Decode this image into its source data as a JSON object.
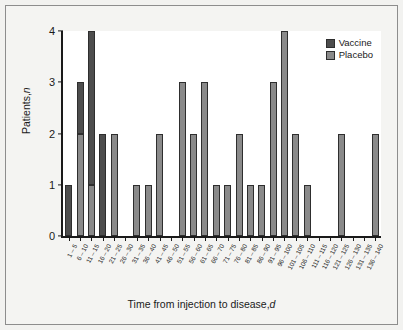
{
  "chart_data": {
    "type": "bar",
    "stacked": true,
    "title": "",
    "xlabel": "Time from injection to disease, d",
    "xlabel_plain": "Time from injection to disease,",
    "xlabel_italic": "d",
    "ylabel": "Patients, n",
    "ylabel_plain": "Patients,",
    "ylabel_italic": "n",
    "ylim": [
      0,
      4
    ],
    "yticks": [
      0,
      1,
      2,
      3,
      4
    ],
    "ytick_labels": [
      "0",
      "1",
      "2",
      "3",
      "4"
    ],
    "grid": false,
    "legend_position": "top-right",
    "categories": [
      "1 – 5",
      "6 – 10",
      "11 – 15",
      "16 – 20",
      "21 – 25",
      "26 – 30",
      "31 – 35",
      "36 – 40",
      "41 – 45",
      "46 – 50",
      "51 – 55",
      "56 – 60",
      "61 – 65",
      "66 – 70",
      "71 – 75",
      "76 – 80",
      "81 – 85",
      "86 – 90",
      "91 – 95",
      "96 – 100",
      "101 – 105",
      "106 – 110",
      "111 – 115",
      "116 – 120",
      "121 – 125",
      "126 – 130",
      "131 – 135",
      "136 – 140"
    ],
    "series": [
      {
        "name": "Vaccine",
        "color": "#4d4d4d",
        "values": [
          1,
          1,
          3,
          2,
          0,
          0,
          0,
          0,
          0,
          0,
          0,
          0,
          0,
          0,
          0,
          0,
          0,
          0,
          0,
          0,
          0,
          0,
          0,
          0,
          0,
          0,
          0,
          0
        ]
      },
      {
        "name": "Placebo",
        "color": "#8a8a8a",
        "values": [
          0,
          2,
          1,
          0,
          2,
          0,
          1,
          1,
          2,
          0,
          3,
          2,
          3,
          1,
          1,
          2,
          1,
          1,
          3,
          4,
          2,
          1,
          0,
          0,
          2,
          0,
          0,
          2
        ]
      }
    ],
    "totals": [
      1,
      3,
      4,
      2,
      2,
      0,
      1,
      1,
      2,
      0,
      3,
      2,
      3,
      1,
      1,
      2,
      1,
      1,
      3,
      4,
      2,
      1,
      0,
      0,
      2,
      0,
      0,
      2
    ]
  },
  "legend": {
    "items": [
      {
        "label": "Vaccine",
        "color": "#4d4d4d"
      },
      {
        "label": "Placebo",
        "color": "#8a8a8a"
      }
    ]
  },
  "colors": {
    "vaccine": "#4d4d4d",
    "placebo": "#8a8a8a",
    "axis": "#1a1a1a",
    "panel_background": "#ffffff",
    "figure_background": "#f4f4f2",
    "frame_border": "#8d8d8d"
  }
}
